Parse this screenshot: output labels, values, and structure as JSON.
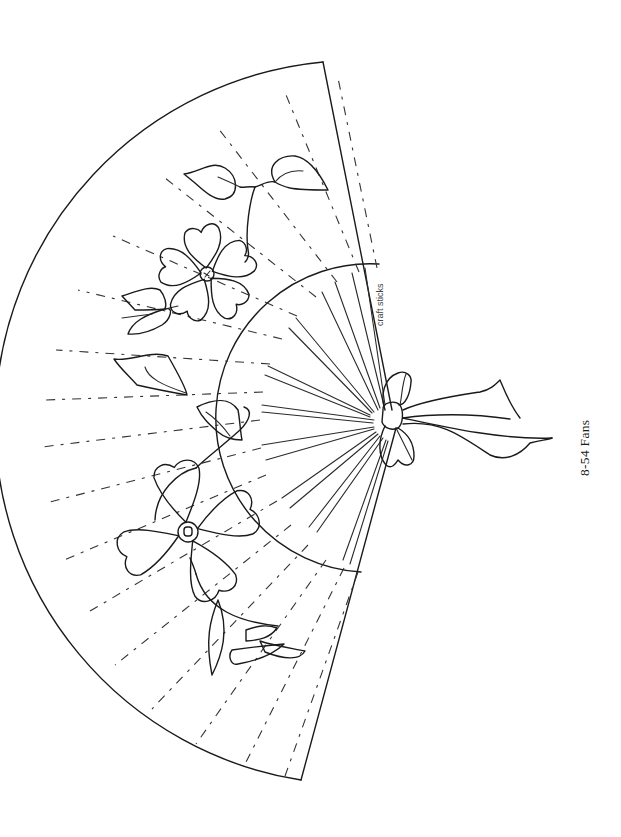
{
  "page": {
    "background": "#ffffff",
    "ink_color": "#1a1a1a"
  },
  "figure": {
    "caption": "8-54  Fans",
    "labels": {
      "craft_sticks": "craft sticks"
    },
    "elements": [
      "fan-outer-arc",
      "fan-inner-arc",
      "fold-lines-dashed",
      "craft-stick-ribs",
      "upper-flower",
      "lower-flower",
      "vine-with-leaves",
      "ribbon-bow"
    ]
  }
}
